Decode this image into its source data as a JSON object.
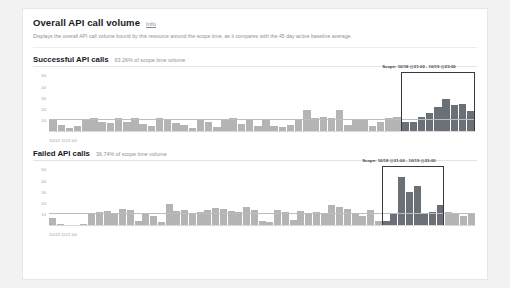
{
  "panel": {
    "title": "Overall API call volume",
    "info_label": "Info",
    "description": "Displays the overall API call volume bound by this resource around the scope time, as it compares with the 45 day active baseline average."
  },
  "chart_data": [
    {
      "type": "bar",
      "id": "successful-api-calls",
      "title": "Successful API calls",
      "subtitle": "63.26% of scope time volume",
      "percent_of_scope_volume": 63.26,
      "ylabel": "",
      "xlabel": "10/12 @21:00",
      "ylim": [
        0,
        55
      ],
      "yticks": [
        50,
        40,
        30,
        20,
        10
      ],
      "grid": false,
      "baseline_value": 10,
      "legend": "",
      "annotation": {
        "label": "Scope: 10/18 @21:00 - 10/19 @23:00",
        "start_index": 43,
        "end_index": 51
      },
      "highlight_color": "#6b6f76",
      "bar_color": "#b4b4b4",
      "values": [
        11,
        6,
        3,
        5,
        11,
        12,
        9,
        8,
        12,
        9,
        12,
        7,
        5,
        12,
        11,
        8,
        6,
        3,
        11,
        9,
        4,
        11,
        12,
        7,
        10,
        5,
        10,
        5,
        4,
        6,
        10,
        19,
        12,
        13,
        12,
        19,
        6,
        11,
        11,
        5,
        9,
        12,
        13,
        9,
        9,
        13,
        17,
        22,
        29,
        24,
        25,
        18
      ]
    },
    {
      "type": "bar",
      "id": "failed-api-calls",
      "title": "Failed API calls",
      "subtitle": "36.74% of scope time volume",
      "percent_of_scope_volume": 36.74,
      "ylabel": "",
      "xlabel": "10/13 @21:00",
      "ylim": [
        0,
        55
      ],
      "yticks": [
        50,
        40,
        30,
        20,
        10
      ],
      "grid": false,
      "baseline_value": 10,
      "legend": "",
      "annotation": {
        "label": "Scope: 10/18 @21:00 - 10/19 @23:00",
        "start_index": 43,
        "end_index": 50
      },
      "highlight_color": "#6b6f76",
      "bar_color": "#b4b4b4",
      "values": [
        7,
        2,
        1,
        1,
        2,
        11,
        12,
        13,
        10,
        15,
        14,
        4,
        11,
        9,
        3,
        19,
        13,
        14,
        11,
        12,
        14,
        16,
        15,
        13,
        12,
        17,
        14,
        4,
        3,
        14,
        12,
        5,
        13,
        11,
        12,
        11,
        18,
        17,
        15,
        11,
        9,
        14,
        4,
        4,
        11,
        43,
        30,
        35,
        10,
        12,
        18,
        12,
        10,
        9,
        11
      ]
    }
  ]
}
